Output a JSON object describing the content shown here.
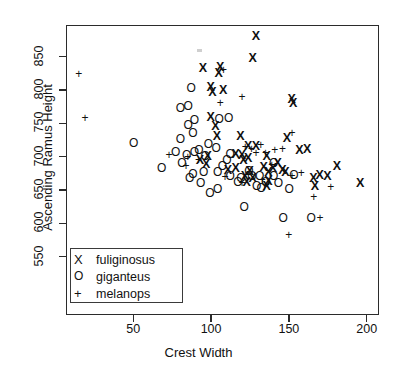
{
  "figure": {
    "width": 397,
    "height": 377,
    "background": "#ffffff",
    "foreground": "#101010"
  },
  "axes": {
    "ylabel": "Ascending Ramus Height",
    "xlabel": "Crest Width",
    "yticks": [
      550,
      600,
      650,
      700,
      750,
      800,
      850
    ],
    "xticks": [
      50,
      100,
      150,
      200
    ]
  },
  "legend": {
    "position": "bottom-left",
    "entries": [
      {
        "symbol": "X",
        "label": "fuliginosus"
      },
      {
        "symbol": "O",
        "label": "giganteus"
      },
      {
        "symbol": "+",
        "label": "melanops"
      }
    ]
  },
  "chart_data": {
    "type": "scatter",
    "title": "",
    "xlabel": "Crest Width",
    "ylabel": "Ascending Ramus Height",
    "xlim": [
      7,
      208
    ],
    "ylim": [
      538,
      894
    ],
    "grid": false,
    "legend_position": "bottom-left",
    "series": [
      {
        "name": "fuliginosus",
        "marker": "X",
        "points": [
          [
            95,
            833
          ],
          [
            101,
            797
          ],
          [
            106,
            834
          ],
          [
            129,
            880
          ],
          [
            127,
            847
          ],
          [
            105,
            825
          ],
          [
            100,
            804
          ],
          [
            108,
            799
          ],
          [
            152,
            786
          ],
          [
            153,
            780
          ],
          [
            100,
            759
          ],
          [
            103,
            745
          ],
          [
            104,
            731
          ],
          [
            119,
            731
          ],
          [
            124,
            716
          ],
          [
            129,
            716
          ],
          [
            162,
            711
          ],
          [
            116,
            704
          ],
          [
            120,
            702
          ],
          [
            124,
            697
          ],
          [
            121,
            695
          ],
          [
            136,
            701
          ],
          [
            111,
            679
          ],
          [
            116,
            683
          ],
          [
            125,
            678
          ],
          [
            122,
            670
          ],
          [
            127,
            668
          ],
          [
            123,
            662
          ],
          [
            137,
            677
          ],
          [
            148,
            676
          ],
          [
            137,
            663
          ],
          [
            146,
            679
          ],
          [
            98,
            700
          ],
          [
            93,
            695
          ],
          [
            97,
            689
          ],
          [
            134,
            684
          ],
          [
            140,
            682
          ],
          [
            149,
            728
          ],
          [
            196,
            660
          ],
          [
            170,
            672
          ],
          [
            175,
            671
          ],
          [
            166,
            668
          ],
          [
            167,
            655
          ],
          [
            181,
            686
          ],
          [
            157,
            710
          ],
          [
            143,
            690
          ],
          [
            136,
            655
          ]
        ]
      },
      {
        "name": "giganteus",
        "marker": "O",
        "points": [
          [
            85,
            775
          ],
          [
            80,
            773
          ],
          [
            85,
            747
          ],
          [
            87,
            802
          ],
          [
            111,
            757
          ],
          [
            105,
            756
          ],
          [
            89,
            754
          ],
          [
            88,
            735
          ],
          [
            80,
            726
          ],
          [
            98,
            718
          ],
          [
            103,
            713
          ],
          [
            92,
            710
          ],
          [
            89,
            706
          ],
          [
            84,
            702
          ],
          [
            77,
            706
          ],
          [
            50,
            720
          ],
          [
            96,
            700
          ],
          [
            81,
            690
          ],
          [
            68,
            682
          ],
          [
            110,
            695
          ],
          [
            107,
            686
          ],
          [
            104,
            676
          ],
          [
            95,
            676
          ],
          [
            88,
            673
          ],
          [
            112,
            671
          ],
          [
            119,
            667
          ],
          [
            124,
            678
          ],
          [
            126,
            671
          ],
          [
            131,
            670
          ],
          [
            140,
            670
          ],
          [
            135,
            662
          ],
          [
            117,
            661
          ],
          [
            129,
            655
          ],
          [
            150,
            651
          ],
          [
            104,
            651
          ],
          [
            99,
            645
          ],
          [
            121,
            624
          ],
          [
            146,
            608
          ],
          [
            164,
            608
          ],
          [
            153,
            672
          ],
          [
            140,
            690
          ],
          [
            112,
            703
          ],
          [
            143,
            660
          ],
          [
            132,
            652
          ],
          [
            93,
            660
          ],
          [
            86,
            668
          ]
        ]
      },
      {
        "name": "melanops",
        "marker": "+",
        "points": [
          [
            15,
            824
          ],
          [
            19,
            758
          ],
          [
            106,
            781
          ],
          [
            108,
            830
          ],
          [
            120,
            790
          ],
          [
            122,
            715
          ],
          [
            126,
            712
          ],
          [
            132,
            718
          ],
          [
            129,
            706
          ],
          [
            135,
            706
          ],
          [
            141,
            710
          ],
          [
            146,
            712
          ],
          [
            152,
            735
          ],
          [
            73,
            703
          ],
          [
            85,
            699
          ],
          [
            84,
            686
          ],
          [
            92,
            695
          ],
          [
            139,
            688
          ],
          [
            158,
            676
          ],
          [
            120,
            660
          ],
          [
            170,
            608
          ],
          [
            150,
            583
          ],
          [
            152,
            671
          ],
          [
            166,
            639
          ],
          [
            177,
            654
          ],
          [
            109,
            670
          ],
          [
            133,
            665
          ]
        ]
      }
    ]
  }
}
